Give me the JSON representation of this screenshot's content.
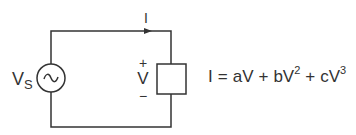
{
  "diagram": {
    "type": "circuit",
    "source": {
      "label": "V",
      "subscript": "S",
      "symbol": "~"
    },
    "current": {
      "label": "I"
    },
    "device": {
      "plus": "+",
      "voltage_label": "V",
      "minus": "−"
    },
    "equation": {
      "lhs": "I",
      "eq": "=",
      "t1": "aV",
      "plus1": "+",
      "t2_base": "bV",
      "t2_exp": "2",
      "plus2": "+",
      "t3_base": "cV",
      "t3_exp": "3"
    },
    "colors": {
      "line": "#333333",
      "background": "#ffffff"
    }
  }
}
